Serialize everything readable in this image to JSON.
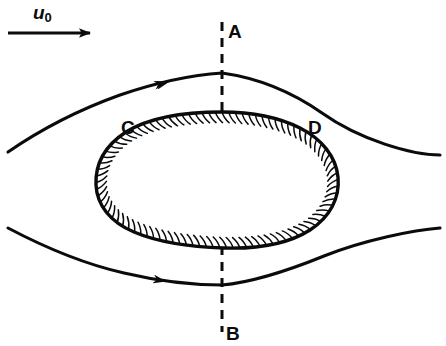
{
  "figure": {
    "kind": "fluid-flow-streamline-diagram",
    "background_color": "#ffffff",
    "ink_color": "#0b0b0b",
    "labels": {
      "freestream_velocity": "u",
      "freestream_velocity_subscript": "0",
      "point_top": "A",
      "point_bottom": "B",
      "point_left": "C",
      "point_right": "D"
    },
    "annotations": {
      "freestream_arrow": "horizontal arrow pointing right indicating uniform oncoming flow u0",
      "symmetry_line": "vertical dashed line through A and B",
      "body": "closed hatched bluff body (cross-hatched boundary, hatch marks inward)",
      "streamlines": "two curved streamlines, one above and one below the body, each carrying a flow-direction arrowhead pointing right"
    }
  },
  "chart_data": {
    "type": "line",
    "title": "",
    "xlabel": "",
    "ylabel": "",
    "grid": false,
    "legend": "none",
    "freestream_arrow": {
      "x1": 8,
      "y1": 33,
      "x2": 95,
      "y2": 33
    },
    "dashed_axis": {
      "x": 222,
      "y_top": 22,
      "y_bottom": 332,
      "dash": "9 7"
    },
    "series": [
      {
        "name": "upper-streamline",
        "points": [
          [
            8,
            152
          ],
          [
            55,
            122
          ],
          [
            110,
            98
          ],
          [
            168,
            81
          ],
          [
            222,
            73
          ],
          [
            280,
            78
          ],
          [
            340,
            100
          ],
          [
            395,
            130
          ],
          [
            440,
            155
          ]
        ],
        "arrow_at": [
          168,
          81
        ]
      },
      {
        "name": "lower-streamline",
        "points": [
          [
            8,
            228
          ],
          [
            60,
            250
          ],
          [
            115,
            268
          ],
          [
            165,
            280
          ],
          [
            222,
            285
          ],
          [
            282,
            277
          ],
          [
            340,
            256
          ],
          [
            396,
            238
          ],
          [
            440,
            228
          ]
        ],
        "arrow_at": [
          165,
          280
        ]
      }
    ],
    "body_outline": {
      "name": "hatched-body",
      "points": [
        [
          222,
          112
        ],
        [
          262,
          114
        ],
        [
          296,
          124
        ],
        [
          322,
          141
        ],
        [
          336,
          163
        ],
        [
          338,
          190
        ],
        [
          328,
          215
        ],
        [
          305,
          233
        ],
        [
          274,
          243
        ],
        [
          236,
          247
        ],
        [
          196,
          246
        ],
        [
          156,
          240
        ],
        [
          124,
          227
        ],
        [
          103,
          207
        ],
        [
          96,
          184
        ],
        [
          101,
          159
        ],
        [
          118,
          137
        ],
        [
          148,
          121
        ],
        [
          186,
          113
        ]
      ]
    }
  }
}
